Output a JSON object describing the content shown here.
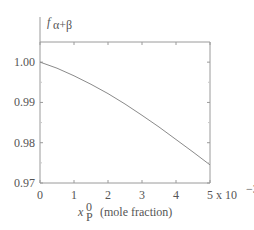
{
  "chart_data": {
    "type": "line",
    "title": "",
    "ylabel": "f_{α+β}",
    "ylabel_main": "f",
    "ylabel_sub": "α+β",
    "xlabel_var": "x",
    "xlabel_sup": "0",
    "xlabel_sub": "P",
    "xlabel_text": "(mole fraction)",
    "x_multiplier": "x 10",
    "x_multiplier_exp": "−3",
    "xlim": [
      0,
      5
    ],
    "ylim": [
      0.97,
      1.005
    ],
    "xticks": [
      "0",
      "1",
      "2",
      "3",
      "4",
      "5"
    ],
    "yticks": [
      "1.00",
      "0.99",
      "0.98",
      "0.97"
    ],
    "ytick_values": [
      1.0,
      0.99,
      0.98,
      0.97
    ],
    "grid": false,
    "series": [
      {
        "name": "f_{α+β}",
        "x": [
          0,
          0.5,
          1,
          1.5,
          2,
          2.5,
          3,
          3.5,
          4,
          4.5,
          5
        ],
        "values": [
          1.0,
          0.9985,
          0.9966,
          0.9945,
          0.9922,
          0.9896,
          0.9868,
          0.9839,
          0.9808,
          0.9777,
          0.9745
        ]
      }
    ]
  }
}
